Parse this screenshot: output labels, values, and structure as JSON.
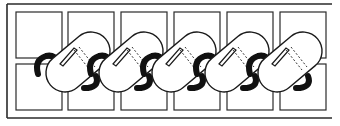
{
  "diagram": {
    "grid": {
      "columns": 6,
      "rows": 2,
      "cell_width": 46,
      "cell_height": 38,
      "origin_x": 16,
      "origin_y": 12,
      "gap": 7
    },
    "frame": {
      "top_y": 4,
      "bottom_y": 118,
      "left_x": 7,
      "right_x": 332
    },
    "links": {
      "count": 5,
      "start_x": 60,
      "spacing": 53,
      "center_y": 62
    },
    "colors": {
      "line": "#2a2a2a",
      "hook": "#111111",
      "fill": "#ffffff"
    }
  }
}
